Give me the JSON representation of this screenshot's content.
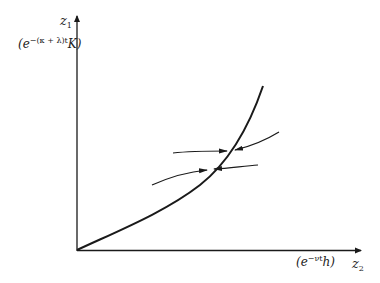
{
  "figure": {
    "type": "phase-diagram",
    "y_axis": {
      "label_main": "z",
      "label_sub": "1",
      "tick_label": "(e^{-(κ+λ)t}K)",
      "tick_label_base": "(e",
      "tick_label_exp": "−(κ + λ)t",
      "tick_label_tail": "K)"
    },
    "x_axis": {
      "label_main": "z",
      "label_sub": "2",
      "tick_label": "(e^{-νt}h)",
      "tick_label_base": "(e",
      "tick_label_exp": "−νt",
      "tick_label_tail": "h)"
    },
    "curve": {
      "description": "convex increasing boundary curve from origin",
      "color": "#1a1a1a"
    },
    "arrows": [
      {
        "id": "upper-left",
        "direction": "right"
      },
      {
        "id": "upper-right",
        "direction": "left"
      },
      {
        "id": "lower-left",
        "direction": "right"
      },
      {
        "id": "lower-right",
        "direction": "left"
      }
    ]
  }
}
